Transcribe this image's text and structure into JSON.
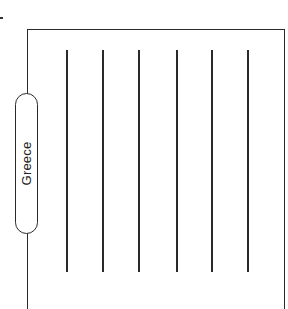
{
  "diagram": {
    "label": "Greece",
    "frame": {
      "left": 27,
      "top": 29,
      "right": 285,
      "line_color": "#2a2a2a"
    },
    "vertical_lines": [
      {
        "x": 66,
        "y_start": 50,
        "y_end": 272
      },
      {
        "x": 102,
        "y_start": 50,
        "y_end": 272
      },
      {
        "x": 138,
        "y_start": 50,
        "y_end": 272
      },
      {
        "x": 176,
        "y_start": 50,
        "y_end": 272
      },
      {
        "x": 211,
        "y_start": 50,
        "y_end": 272
      },
      {
        "x": 247,
        "y_start": 50,
        "y_end": 272
      }
    ],
    "pill": {
      "left": 15,
      "top": 93,
      "width": 23,
      "height": 141,
      "orientation": "vertical"
    }
  }
}
